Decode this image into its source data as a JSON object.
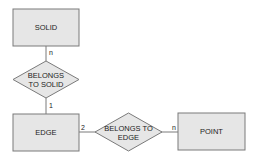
{
  "diagram": {
    "type": "entity-relationship",
    "colors": {
      "fill": "#e6e6e6",
      "stroke": "#7a7a7a",
      "text": "#222222",
      "background": "#ffffff"
    },
    "entities": [
      {
        "id": "solid",
        "label": "SOLID"
      },
      {
        "id": "edge",
        "label": "EDGE"
      },
      {
        "id": "point",
        "label": "POINT"
      }
    ],
    "relationships": [
      {
        "id": "belongs_to_solid",
        "label_line1": "BELONGS",
        "label_line2": "TO SOLID"
      },
      {
        "id": "belongs_to_edge",
        "label_line1": "BELONGS TO",
        "label_line2": "EDGE"
      }
    ],
    "cardinalities": {
      "solid_side": "n",
      "edge_to_solid_side": "1",
      "edge_to_point_side": "2",
      "point_side": "n"
    }
  }
}
